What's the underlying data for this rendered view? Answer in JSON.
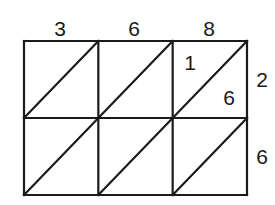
{
  "multiplicand_digits": [
    "3",
    "6",
    "8"
  ],
  "multiplier_digits": [
    "2",
    "6"
  ],
  "grid": {
    "rows": 2,
    "cols": 3
  },
  "cells": [
    {
      "row": 0,
      "col": 2,
      "tens": "1",
      "ones": "6"
    }
  ],
  "colors": {
    "line": "#1a1a1a",
    "background": "#ffffff"
  }
}
